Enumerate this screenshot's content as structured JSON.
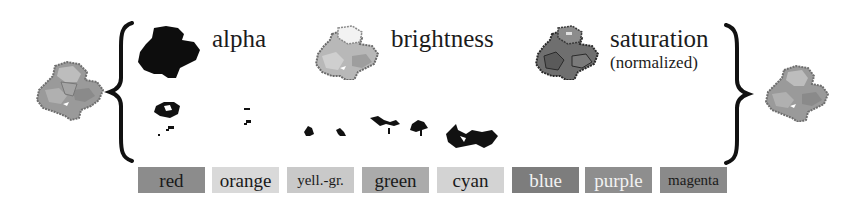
{
  "channels": [
    {
      "id": "alpha",
      "label": "alpha",
      "sublabel": ""
    },
    {
      "id": "brightness",
      "label": "brightness",
      "sublabel": ""
    },
    {
      "id": "saturation",
      "label": "saturation",
      "sublabel": "(normalized)"
    }
  ],
  "hue_bins": [
    {
      "label": "red",
      "bg": "#8c8c8c",
      "fg": "#1a1a1a"
    },
    {
      "label": "orange",
      "bg": "#d9d9d9",
      "fg": "#1a1a1a"
    },
    {
      "label": "yell.-gr.",
      "bg": "#c9c9c9",
      "fg": "#1a1a1a"
    },
    {
      "label": "green",
      "bg": "#ababab",
      "fg": "#1a1a1a"
    },
    {
      "label": "cyan",
      "bg": "#d3d3d3",
      "fg": "#1a1a1a"
    },
    {
      "label": "blue",
      "bg": "#7d7d7d",
      "fg": "#f2f2f2"
    },
    {
      "label": "purple",
      "bg": "#8e8e8e",
      "fg": "#f2f2f2"
    },
    {
      "label": "magenta",
      "bg": "#8a8a8a",
      "fg": "#1a1a1a"
    }
  ],
  "braces": {
    "left": "{",
    "right": "}"
  },
  "icons": {
    "input": "flower-sprite-icon",
    "output": "flower-sprite-reconstructed-icon",
    "alpha": "alpha-mask-icon",
    "brightness": "brightness-map-icon",
    "saturation": "saturation-map-icon"
  }
}
